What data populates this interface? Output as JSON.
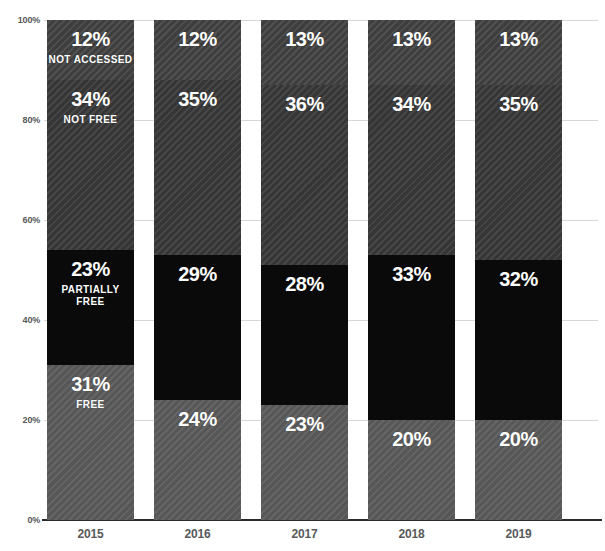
{
  "chart_data": {
    "type": "bar",
    "subtype": "stacked-bar-100",
    "title": "",
    "subtitle": "",
    "xlabel": "",
    "ylabel": "",
    "ylim": [
      0,
      100
    ],
    "grid": true,
    "legend_position": "in-bar-labels",
    "categories": [
      "2015",
      "2016",
      "2017",
      "2018",
      "2019"
    ],
    "ytick_labels": [
      "0%",
      "20%",
      "40%",
      "60%",
      "80%",
      "100%"
    ],
    "ytick_values": [
      0,
      20,
      40,
      60,
      80,
      100
    ],
    "series": [
      {
        "name": "FREE",
        "color": "#5c5c5c",
        "values": [
          31,
          24,
          23,
          20,
          20
        ]
      },
      {
        "name": "PARTIALLY FREE",
        "color": "#0a0a0a",
        "values": [
          23,
          29,
          28,
          33,
          32
        ]
      },
      {
        "name": "NOT FREE",
        "color": "#3c3c3c",
        "values": [
          34,
          35,
          36,
          34,
          35
        ]
      },
      {
        "name": "NOT ACCESSED",
        "color": "#454545",
        "values": [
          12,
          12,
          13,
          13,
          13
        ]
      }
    ],
    "value_labels": {
      "2015": {
        "FREE": "31%",
        "PARTIALLY FREE": "23%",
        "NOT FREE": "34%",
        "NOT ACCESSED": "12%"
      },
      "2016": {
        "FREE": "24%",
        "PARTIALLY FREE": "29%",
        "NOT FREE": "35%",
        "NOT ACCESSED": "12%"
      },
      "2017": {
        "FREE": "23%",
        "PARTIALLY FREE": "28%",
        "NOT FREE": "36%",
        "NOT ACCESSED": "13%"
      },
      "2018": {
        "FREE": "20%",
        "PARTIALLY FREE": "33%",
        "NOT FREE": "34%",
        "NOT ACCESSED": "13%"
      },
      "2019": {
        "FREE": "20%",
        "PARTIALLY FREE": "32%",
        "NOT FREE": "35%",
        "NOT ACCESSED": "13%"
      }
    },
    "series_name_shown_on": "2015"
  },
  "axis": {
    "y_ticks": [
      {
        "label": "100%",
        "value": 100
      },
      {
        "label": "80%",
        "value": 80
      },
      {
        "label": "60%",
        "value": 60
      },
      {
        "label": "40%",
        "value": 40
      },
      {
        "label": "20%",
        "value": 20
      },
      {
        "label": "0%",
        "value": 0
      }
    ],
    "x_ticks": [
      {
        "label": "2015"
      },
      {
        "label": "2016"
      },
      {
        "label": "2017"
      },
      {
        "label": "2018"
      },
      {
        "label": "2019"
      }
    ]
  },
  "colors": {
    "free": "#5c5c5c",
    "partially_free": "#0a0a0a",
    "not_free": "#3c3c3c",
    "not_accessed": "#454545",
    "gridline": "#d8d8d8",
    "axis": "#2a2a2a",
    "tick_text": "#58595b",
    "label_text": "#ffffff",
    "background": "#ffffff"
  }
}
